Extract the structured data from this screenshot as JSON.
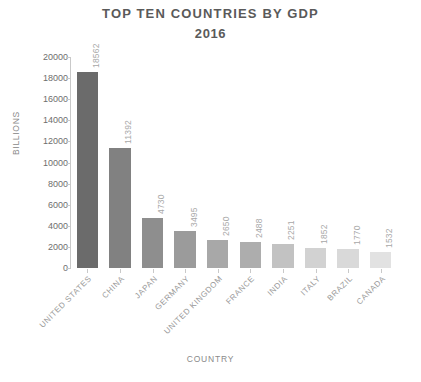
{
  "chart_data": {
    "type": "bar",
    "title": "TOP TEN COUNTRIES BY GDP",
    "subtitle": "2016",
    "xlabel": "COUNTRY",
    "ylabel": "BILLIONS",
    "categories": [
      "UNITED STATES",
      "CHINA",
      "JAPAN",
      "GERMANY",
      "UNITED KINGDOM",
      "FRANCE",
      "INDIA",
      "ITALY",
      "BRAZIL",
      "CANADA"
    ],
    "values": [
      18562,
      11392,
      4730,
      3495,
      2650,
      2488,
      2251,
      1852,
      1770,
      1532
    ],
    "value_labels": [
      "18562",
      "11392",
      "4730",
      "3495",
      "2650",
      "2488",
      "2251",
      "1852",
      "1770",
      "1532"
    ],
    "bar_colors": [
      "#6b6b6b",
      "#818181",
      "#8e8e8e",
      "#9b9b9b",
      "#a8a8a8",
      "#adadad",
      "#c2c2c2",
      "#d2d2d2",
      "#d9d9d9",
      "#e2e2e2"
    ],
    "ylim": [
      0,
      20000
    ],
    "yticks": [
      0,
      2000,
      4000,
      6000,
      8000,
      10000,
      12000,
      14000,
      16000,
      18000,
      20000
    ],
    "ytick_labels": [
      "0",
      "2000",
      "4000",
      "6000",
      "8000",
      "10000",
      "12000",
      "14000",
      "16000",
      "18000",
      "20000"
    ],
    "grid": false,
    "legend": false,
    "axis_color": "#c9c9c9",
    "title_color": "#5a5a5a",
    "label_color": "#9a9a9a",
    "background": "#ffffff"
  }
}
